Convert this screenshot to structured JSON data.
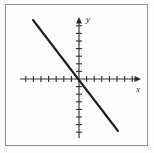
{
  "figure": {
    "kind": "cartesian-line-graph",
    "background_color": "#fefefe",
    "border_color": "#8d8f91",
    "ink_color": "#1d1d1d"
  },
  "axes": {
    "x_label": "x",
    "y_label": "y",
    "origin_px": {
      "x": 79,
      "y": 79
    },
    "tick_spacing_px": 7.6,
    "tick_half_length_px": 3,
    "x_axis": {
      "start_px": 20,
      "end_px": 141,
      "ticks_negative": 8,
      "ticks_positive": 8,
      "has_arrow_positive": true,
      "has_arrow_negative": false
    },
    "y_axis": {
      "start_px": 17,
      "end_px": 138,
      "ticks_positive": 8,
      "ticks_negative": 8,
      "has_arrow_positive": true,
      "has_arrow_negative": false
    }
  },
  "chart_data": {
    "type": "line",
    "title": "",
    "xlabel": "x",
    "ylabel": "y",
    "grid": false,
    "legend": "none",
    "xlim": [
      -8,
      8
    ],
    "ylim": [
      -8,
      8
    ],
    "xticks": [
      -8,
      -7,
      -6,
      -5,
      -4,
      -3,
      -2,
      -1,
      0,
      1,
      2,
      3,
      4,
      5,
      6,
      7,
      8
    ],
    "yticks": [
      -8,
      -7,
      -6,
      -5,
      -4,
      -3,
      -2,
      -1,
      0,
      1,
      2,
      3,
      4,
      5,
      6,
      7,
      8
    ],
    "tick_labels_shown": false,
    "series": [
      {
        "name": "line",
        "slope": -1.3,
        "intercept": 0,
        "x": [
          -6.1,
          5.1
        ],
        "y": [
          7.8,
          -6.8
        ],
        "endpoints_px": [
          {
            "x": 33,
            "y": 20
          },
          {
            "x": 118,
            "y": 131
          }
        ]
      }
    ]
  }
}
